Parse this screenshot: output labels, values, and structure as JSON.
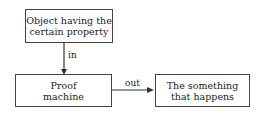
{
  "diagram": {
    "nodes": [
      {
        "id": "object",
        "lines": [
          "Object having the",
          "certain property"
        ]
      },
      {
        "id": "machine",
        "lines": [
          "Proof",
          "machine"
        ]
      },
      {
        "id": "result",
        "lines": [
          "The something",
          "that happens"
        ]
      }
    ],
    "edges": [
      {
        "from": "object",
        "to": "machine",
        "label": "in"
      },
      {
        "from": "machine",
        "to": "result",
        "label": "out"
      }
    ],
    "colors": {
      "line": "#333333",
      "text": "#222222",
      "background": "#ffffff"
    }
  }
}
